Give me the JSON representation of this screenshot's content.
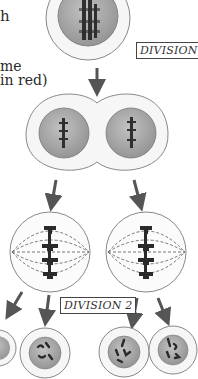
{
  "caption": {
    "line1": "h",
    "line2": "me",
    "line3": "in red)"
  },
  "labels": {
    "division1": "DIVISION 1",
    "division2": "DIVISION 2"
  },
  "colors": {
    "cytoplasm": "#f4f4f4",
    "nucleus": "#a8a8a8",
    "chromosome": "#2f2f2f",
    "arrow": "#555555",
    "outline": "#777777"
  }
}
